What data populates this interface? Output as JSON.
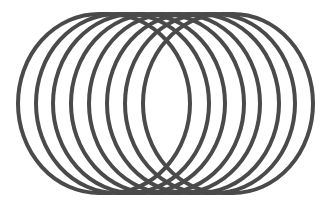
{
  "figure": {
    "ring_count": 8,
    "stroke_color": "#4a4a4a",
    "stroke_width": 4,
    "background": "#ffffff",
    "rings": [
      {
        "left": 18,
        "right": 190,
        "top": 14,
        "bottom": 193
      },
      {
        "left": 36,
        "right": 209,
        "top": 14,
        "bottom": 193
      },
      {
        "left": 53,
        "right": 225,
        "top": 14,
        "bottom": 193
      },
      {
        "left": 71,
        "right": 244,
        "top": 14,
        "bottom": 193
      },
      {
        "left": 89,
        "right": 260,
        "top": 14,
        "bottom": 193
      },
      {
        "left": 107,
        "right": 279,
        "top": 14,
        "bottom": 193
      },
      {
        "left": 125,
        "right": 295,
        "top": 14,
        "bottom": 193
      },
      {
        "left": 143,
        "right": 313,
        "top": 14,
        "bottom": 193
      }
    ]
  }
}
